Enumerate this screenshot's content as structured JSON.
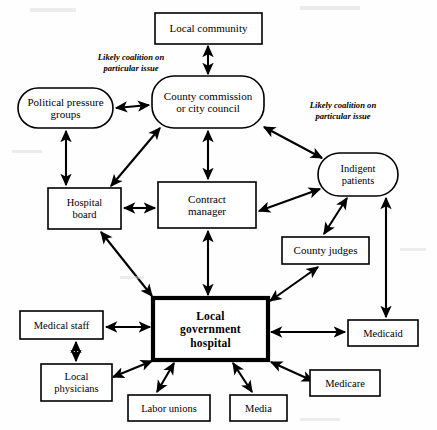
{
  "figure": {
    "type": "organizational-stakeholder-diagram",
    "center_node": "Local government hospital"
  },
  "nodes": [
    {
      "id": "local-community",
      "label_lines": [
        "Local community"
      ],
      "shape": "rect",
      "x": 155,
      "y": 13,
      "w": 107,
      "h": 31,
      "emphasis": "normal"
    },
    {
      "id": "political-pressure",
      "label_lines": [
        "Political pressure",
        "groups"
      ],
      "shape": "round",
      "x": 18,
      "y": 88,
      "w": 95,
      "h": 40,
      "emphasis": "normal"
    },
    {
      "id": "county-commission",
      "label_lines": [
        "County commission",
        "or city council"
      ],
      "shape": "round",
      "x": 152,
      "y": 76,
      "w": 112,
      "h": 52,
      "emphasis": "normal"
    },
    {
      "id": "indigent-patients",
      "label_lines": [
        "Indigent",
        "patients"
      ],
      "shape": "round",
      "x": 318,
      "y": 153,
      "w": 80,
      "h": 43,
      "emphasis": "normal"
    },
    {
      "id": "hospital-board",
      "label_lines": [
        "Hospital",
        "board"
      ],
      "shape": "rect",
      "x": 48,
      "y": 188,
      "w": 73,
      "h": 41,
      "emphasis": "normal"
    },
    {
      "id": "contract-manager",
      "label_lines": [
        "Contract",
        "manager"
      ],
      "shape": "rect",
      "x": 158,
      "y": 182,
      "w": 98,
      "h": 46,
      "emphasis": "normal"
    },
    {
      "id": "county-judges",
      "label_lines": [
        "County judges"
      ],
      "shape": "rect",
      "x": 282,
      "y": 237,
      "w": 87,
      "h": 27,
      "emphasis": "normal"
    },
    {
      "id": "local-government-hospital",
      "label_lines": [
        "Local",
        "government",
        "hospital"
      ],
      "shape": "rect",
      "x": 153,
      "y": 298,
      "w": 115,
      "h": 62,
      "emphasis": "bold"
    },
    {
      "id": "medical-staff",
      "label_lines": [
        "Medical staff"
      ],
      "shape": "rect",
      "x": 20,
      "y": 311,
      "w": 83,
      "h": 28,
      "emphasis": "normal"
    },
    {
      "id": "medicaid",
      "label_lines": [
        "Medicaid"
      ],
      "shape": "rect",
      "x": 348,
      "y": 320,
      "w": 70,
      "h": 26,
      "emphasis": "normal"
    },
    {
      "id": "local-physicians",
      "label_lines": [
        "Local",
        "physicians"
      ],
      "shape": "rect",
      "x": 41,
      "y": 364,
      "w": 71,
      "h": 37,
      "emphasis": "normal"
    },
    {
      "id": "medicare",
      "label_lines": [
        "Medicare"
      ],
      "shape": "rect",
      "x": 310,
      "y": 370,
      "w": 70,
      "h": 26,
      "emphasis": "normal"
    },
    {
      "id": "labor-unions",
      "label_lines": [
        "Labor unions"
      ],
      "shape": "rect",
      "x": 128,
      "y": 395,
      "w": 82,
      "h": 26,
      "emphasis": "normal"
    },
    {
      "id": "media",
      "label_lines": [
        "Media"
      ],
      "shape": "rect",
      "x": 230,
      "y": 395,
      "w": 57,
      "h": 26,
      "emphasis": "normal"
    }
  ],
  "annotations": [
    {
      "id": "annot-left",
      "lines": [
        "Likely coalition  on",
        "particular issue"
      ],
      "x": 131,
      "y": 60
    },
    {
      "id": "annot-right",
      "lines": [
        "Likely coalition  on",
        "particular issue"
      ],
      "x": 343,
      "y": 108
    }
  ],
  "edges": [
    {
      "id": "edge-community-commission",
      "from": "local-community",
      "to": "county-commission",
      "arrows": "both",
      "points": [
        [
          208,
          46
        ],
        [
          208,
          74
        ]
      ]
    },
    {
      "id": "edge-pressure-commission",
      "from": "political-pressure",
      "to": "county-commission",
      "arrows": "both",
      "points": [
        [
          116,
          108
        ],
        [
          149,
          105
        ]
      ]
    },
    {
      "id": "edge-pressure-board",
      "from": "political-pressure",
      "to": "hospital-board",
      "arrows": "both",
      "points": [
        [
          66,
          131
        ],
        [
          66,
          185
        ]
      ]
    },
    {
      "id": "edge-commission-board",
      "from": "county-commission",
      "to": "hospital-board",
      "arrows": "both",
      "points": [
        [
          160,
          128
        ],
        [
          111,
          186
        ]
      ]
    },
    {
      "id": "edge-commission-contract",
      "from": "county-commission",
      "to": "contract-manager",
      "arrows": "both",
      "points": [
        [
          208,
          131
        ],
        [
          208,
          179
        ]
      ]
    },
    {
      "id": "edge-commission-indigent",
      "from": "county-commission",
      "to": "indigent-patients",
      "arrows": "both",
      "points": [
        [
          264,
          127
        ],
        [
          322,
          158
        ]
      ]
    },
    {
      "id": "edge-board-contract",
      "from": "hospital-board",
      "to": "contract-manager",
      "arrows": "both",
      "points": [
        [
          124,
          208
        ],
        [
          155,
          208
        ]
      ]
    },
    {
      "id": "edge-contract-indigent",
      "from": "contract-manager",
      "to": "indigent-patients",
      "arrows": "both",
      "points": [
        [
          259,
          211
        ],
        [
          320,
          189
        ]
      ]
    },
    {
      "id": "edge-indigent-judges",
      "from": "indigent-patients",
      "to": "county-judges",
      "arrows": "both",
      "points": [
        [
          347,
          198
        ],
        [
          324,
          234
        ]
      ]
    },
    {
      "id": "edge-indigent-medicaid",
      "from": "indigent-patients",
      "to": "medicaid",
      "arrows": "both",
      "points": [
        [
          386,
          198
        ],
        [
          386,
          317
        ]
      ]
    },
    {
      "id": "edge-board-hospital",
      "from": "hospital-board",
      "to": "local-government-hospital",
      "arrows": "both",
      "points": [
        [
          101,
          232
        ],
        [
          152,
          296
        ]
      ]
    },
    {
      "id": "edge-contract-hospital",
      "from": "contract-manager",
      "to": "local-government-hospital",
      "arrows": "both",
      "points": [
        [
          208,
          231
        ],
        [
          208,
          295
        ]
      ]
    },
    {
      "id": "edge-judges-hospital",
      "from": "county-judges",
      "to": "local-government-hospital",
      "arrows": "both",
      "points": [
        [
          318,
          267
        ],
        [
          270,
          301
        ]
      ]
    },
    {
      "id": "edge-staff-hospital",
      "from": "medical-staff",
      "to": "local-government-hospital",
      "arrows": "both",
      "points": [
        [
          106,
          327
        ],
        [
          150,
          327
        ]
      ]
    },
    {
      "id": "edge-staff-physicians",
      "from": "medical-staff",
      "to": "local-physicians",
      "arrows": "both",
      "points": [
        [
          76,
          342
        ],
        [
          76,
          361
        ]
      ]
    },
    {
      "id": "edge-hospital-medicaid",
      "from": "local-government-hospital",
      "to": "medicaid",
      "arrows": "both",
      "points": [
        [
          271,
          332
        ],
        [
          345,
          332
        ]
      ]
    },
    {
      "id": "edge-hospital-physicians",
      "from": "local-government-hospital",
      "to": "local-physicians",
      "arrows": "both",
      "points": [
        [
          152,
          361
        ],
        [
          113,
          377
        ]
      ]
    },
    {
      "id": "edge-hospital-labor",
      "from": "local-government-hospital",
      "to": "labor-unions",
      "arrows": "both",
      "points": [
        [
          174,
          363
        ],
        [
          157,
          392
        ]
      ]
    },
    {
      "id": "edge-hospital-media",
      "from": "local-government-hospital",
      "to": "media",
      "arrows": "both",
      "points": [
        [
          233,
          363
        ],
        [
          252,
          392
        ]
      ]
    },
    {
      "id": "edge-hospital-medicare",
      "from": "local-government-hospital",
      "to": "medicare",
      "arrows": "both",
      "points": [
        [
          271,
          362
        ],
        [
          313,
          381
        ]
      ]
    }
  ]
}
